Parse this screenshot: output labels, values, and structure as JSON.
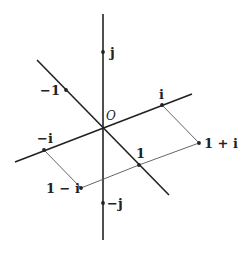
{
  "diagram": {
    "title": "",
    "origin": {
      "label": "O",
      "x": 103,
      "y": 127
    },
    "axes": [
      {
        "id": "j-axis",
        "from": [
          103,
          14
        ],
        "to": [
          103,
          240
        ]
      },
      {
        "id": "real-axis",
        "from": [
          37,
          60
        ],
        "to": [
          169,
          195
        ]
      },
      {
        "id": "i-axis",
        "from": [
          15,
          162
        ],
        "to": [
          192,
          94
        ]
      }
    ],
    "points": [
      {
        "id": "j",
        "label": "j",
        "x": 103,
        "y": 52
      },
      {
        "id": "neg-j",
        "label": "−j",
        "x": 103,
        "y": 203
      },
      {
        "id": "neg-1",
        "label": "−1",
        "x": 66,
        "y": 90
      },
      {
        "id": "one",
        "label": "1",
        "x": 139,
        "y": 165
      },
      {
        "id": "i",
        "label": "i",
        "x": 162,
        "y": 105
      },
      {
        "id": "neg-i",
        "label": "−i",
        "x": 44,
        "y": 150
      },
      {
        "id": "one-plus-i",
        "label": "1 + i",
        "x": 199,
        "y": 143
      },
      {
        "id": "one-minus-i",
        "label": "1 − i",
        "x": 81,
        "y": 188
      }
    ],
    "guides": [
      {
        "from": "i",
        "to": "one-plus-i"
      },
      {
        "from": "one-plus-i",
        "to": "one"
      },
      {
        "from": "one",
        "to": "one-minus-i"
      },
      {
        "from": "one-minus-i",
        "to": "neg-i"
      }
    ],
    "colors": {
      "line": "#222222",
      "guide": "#555555",
      "background": "#ffffff"
    }
  }
}
